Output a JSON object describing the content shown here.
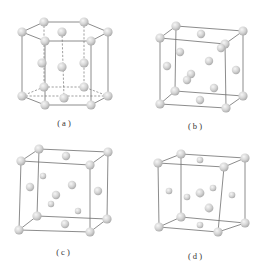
{
  "figure": {
    "panels": [
      {
        "id": "a",
        "label": "( a )",
        "structure": "hexagonal close-packed unit cell"
      },
      {
        "id": "b",
        "label": "( b )",
        "structure": "cubic unit cell with interstitial atoms"
      },
      {
        "id": "c",
        "label": "( c )",
        "structure": "cubic unit cell with interstitial atoms"
      },
      {
        "id": "d",
        "label": "( d )",
        "structure": "cubic unit cell with interstitial atoms"
      }
    ],
    "colors": {
      "atom_fill": "#d6d6d6",
      "atom_highlight": "#f4f4f4",
      "atom_edge": "#a8a8a8",
      "edge_line": "#6e6e6e",
      "background": "#ffffff"
    }
  }
}
